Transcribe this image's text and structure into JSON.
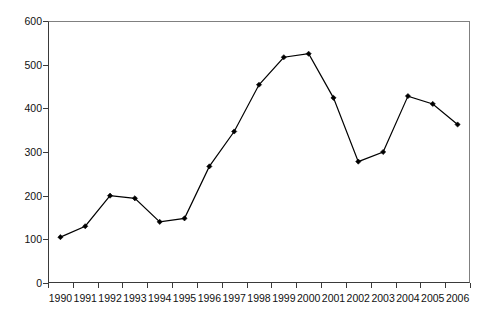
{
  "chart_data": {
    "type": "line",
    "title": "",
    "subtitle": "",
    "xlabel": "",
    "ylabel": "",
    "categories": [
      "1990",
      "1991",
      "1992",
      "1993",
      "1994",
      "1995",
      "1996",
      "1997",
      "1998",
      "1999",
      "2000",
      "2001",
      "2002",
      "2003",
      "2004",
      "2005",
      "2006"
    ],
    "values": [
      105,
      130,
      200,
      194,
      140,
      148,
      267,
      347,
      454,
      517,
      525,
      424,
      278,
      300,
      428,
      410,
      363
    ],
    "series": [
      {
        "name": "series-1",
        "values": [
          105,
          130,
          200,
          194,
          140,
          148,
          267,
          347,
          454,
          517,
          525,
          424,
          278,
          300,
          428,
          410,
          363
        ]
      }
    ],
    "ylim": [
      0,
      600
    ],
    "y_ticks": [
      0,
      100,
      200,
      300,
      400,
      500,
      600
    ],
    "y_tick_labels": [
      "0",
      "100",
      "200",
      "300",
      "400",
      "500",
      "600"
    ],
    "x_tick_labels": [
      "1990",
      "1991",
      "1992",
      "1993",
      "1994",
      "1995",
      "1996",
      "1997",
      "1998",
      "1999",
      "2000",
      "2001",
      "2002",
      "2003",
      "2004",
      "2005",
      "2006"
    ],
    "grid": false,
    "legend": false,
    "legend_position": "none",
    "marker": "diamond",
    "line_color": "#000000",
    "marker_color": "#000000",
    "axis_color": "#3a3a3a",
    "background_color": "#ffffff"
  }
}
